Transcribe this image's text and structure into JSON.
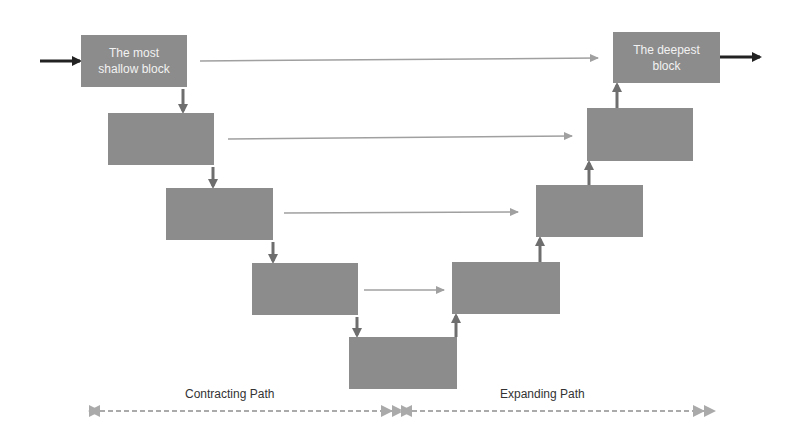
{
  "diagram": {
    "blocks": [
      {
        "id": "enc0",
        "label": "The most shallow block",
        "x": 81,
        "y": 35,
        "w": 106,
        "h": 52
      },
      {
        "id": "enc1",
        "label": "",
        "x": 108,
        "y": 113,
        "w": 106,
        "h": 52
      },
      {
        "id": "enc2",
        "label": "",
        "x": 166,
        "y": 188,
        "w": 107,
        "h": 52
      },
      {
        "id": "enc3",
        "label": "",
        "x": 252,
        "y": 263,
        "w": 106,
        "h": 52
      },
      {
        "id": "bottleneck",
        "label": "",
        "x": 349,
        "y": 337,
        "w": 108,
        "h": 52
      },
      {
        "id": "dec3",
        "label": "",
        "x": 452,
        "y": 262,
        "w": 108,
        "h": 52
      },
      {
        "id": "dec2",
        "label": "",
        "x": 536,
        "y": 185,
        "w": 107,
        "h": 52
      },
      {
        "id": "dec1",
        "label": "",
        "x": 587,
        "y": 108,
        "w": 106,
        "h": 53
      },
      {
        "id": "dec0",
        "label": "The deepest block",
        "x": 613,
        "y": 32,
        "w": 107,
        "h": 51
      }
    ],
    "labels": {
      "contracting": "Contracting Path",
      "expanding": "Expanding Path"
    },
    "colors": {
      "block": "#8c8c8c",
      "arrow_dark": "#222222",
      "arrow_mid": "#6e6e6e",
      "skip": "#a0a0a0",
      "dashed": "#aaaaaa"
    }
  }
}
